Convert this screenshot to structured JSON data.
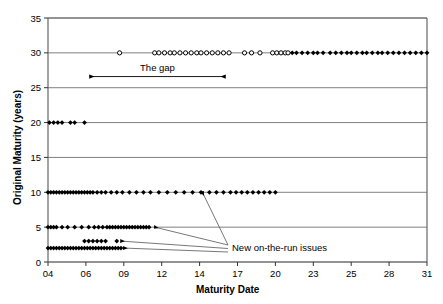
{
  "chart_data": {
    "type": "scatter",
    "title": "",
    "xlabel": "Maturity Date",
    "ylabel": "Original Maturity (years)",
    "xlim": [
      4,
      31
    ],
    "ylim": [
      0,
      35
    ],
    "xticks": [
      "04",
      "06",
      "09",
      "12",
      "14",
      "17",
      "20",
      "23",
      "25",
      "28",
      "31"
    ],
    "xtick_values": [
      4,
      6.7,
      9.4,
      12.1,
      14.8,
      17.5,
      20.2,
      22.9,
      25.6,
      28.3,
      31
    ],
    "yticks": [
      "0",
      "5",
      "10",
      "15",
      "20",
      "25",
      "30",
      "35"
    ],
    "ytick_values": [
      0,
      5,
      10,
      15,
      20,
      25,
      30,
      35
    ],
    "grid": "horizontal",
    "legend": "none",
    "marker_hollow": "circle",
    "marker_filled": "diamond",
    "series": [
      {
        "name": "30-year bonds (old, hollow)",
        "maturity_years": 30,
        "marker": "hollow-circle",
        "x": [
          9.1,
          11.6,
          11.9,
          12.3,
          12.7,
          13.0,
          13.4,
          13.8,
          14.2,
          14.6,
          14.9,
          15.3,
          15.7,
          16.1,
          16.5,
          16.9,
          18.0,
          18.5,
          19.1,
          20.0,
          20.3,
          20.6,
          20.9,
          21.1
        ]
      },
      {
        "name": "30-year bonds (new, filled)",
        "maturity_years": 30,
        "marker": "filled-diamond",
        "x": [
          21.4,
          21.7,
          22.1,
          22.5,
          22.9,
          23.2,
          23.6,
          24.1,
          24.5,
          24.9,
          25.3,
          25.6,
          26.0,
          26.4,
          26.7,
          27.1,
          27.5,
          27.8,
          28.2,
          28.6,
          29.0,
          29.4,
          29.8,
          30.2,
          30.6,
          31.0,
          31.4,
          31.8,
          32.2,
          32.6,
          33.0,
          33.4,
          33.8,
          34.2,
          34.6,
          35.0,
          35.4,
          35.8,
          36.2,
          36.6,
          37.0,
          37.4,
          37.8,
          38.2,
          38.6,
          39.0
        ]
      },
      {
        "name": "20-year bonds",
        "maturity_years": 20,
        "marker": "filled-diamond",
        "x": [
          4.1,
          4.4,
          4.7,
          5.0,
          5.6,
          5.9,
          6.6
        ]
      },
      {
        "name": "10-year notes",
        "maturity_years": 10,
        "marker": "filled-diamond",
        "x": [
          4.0,
          4.2,
          4.4,
          4.6,
          4.8,
          5.0,
          5.2,
          5.4,
          5.6,
          5.8,
          6.0,
          6.2,
          6.4,
          6.6,
          6.8,
          7.0,
          7.2,
          7.5,
          7.8,
          8.1,
          8.5,
          8.9,
          9.3,
          9.8,
          10.3,
          10.8,
          11.3,
          11.9,
          12.5,
          13.1,
          13.7,
          14.3,
          14.9,
          15.5,
          16.0,
          16.5,
          17.0,
          17.4,
          17.8,
          18.2,
          18.6,
          19.0,
          19.4,
          19.8,
          20.2
        ]
      },
      {
        "name": "5-year notes",
        "maturity_years": 5,
        "marker": "filled-diamond",
        "x": [
          4.0,
          4.2,
          4.4,
          4.6,
          5.0,
          5.4,
          5.9,
          6.4,
          6.9,
          7.3,
          7.6,
          7.9,
          8.2,
          8.4,
          8.6,
          8.8,
          9.0,
          9.2,
          9.4,
          9.6,
          9.8,
          10.0,
          10.2,
          10.4,
          10.6,
          10.8,
          11.0,
          11.2
        ]
      },
      {
        "name": "3-year notes",
        "maturity_years": 3,
        "marker": "filled-diamond",
        "x": [
          6.6,
          6.9,
          7.2,
          7.5,
          7.8,
          8.1,
          8.9
        ]
      },
      {
        "name": "2-year notes",
        "maturity_years": 2,
        "marker": "filled-diamond",
        "x": [
          4.0,
          4.2,
          4.4,
          4.6,
          4.8,
          5.0,
          5.2,
          5.4,
          5.6,
          5.8,
          6.0,
          6.2,
          6.4,
          6.6,
          6.8,
          7.0,
          7.2,
          7.4,
          7.6,
          7.8,
          8.0,
          8.2,
          8.4,
          8.6,
          8.8,
          9.0,
          9.2
        ]
      }
    ],
    "annotations": [
      {
        "name": "the-gap",
        "text": "The gap",
        "x_start": 7.0,
        "x_end": 16.6,
        "y": 26.6,
        "arrow": "double-headed"
      },
      {
        "name": "new-on-the-run-issues",
        "text": "New on-the-run issues",
        "targets": [
          {
            "maturity_years": 10,
            "x": 15.0
          },
          {
            "maturity_years": 5,
            "x": 11.6
          },
          {
            "maturity_years": 3,
            "x": 9.2
          },
          {
            "maturity_years": 2,
            "x": 9.4
          }
        ]
      }
    ]
  },
  "axes": {
    "x_title": "Maturity Date",
    "y_title": "Original Maturity (years)"
  },
  "colors": {
    "marker": "#000000",
    "grid": "#808080",
    "frame": "#808080",
    "background": "#ffffff",
    "text": "#000000"
  }
}
